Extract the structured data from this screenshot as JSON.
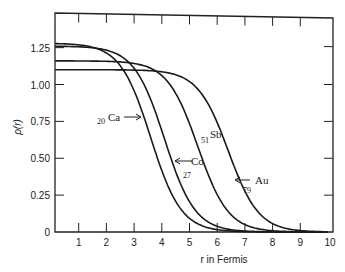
{
  "chart_data": {
    "type": "line",
    "title": "",
    "xlabel": "r  in  Fermis",
    "ylabel": "ρ(r)",
    "xlim": [
      0,
      10
    ],
    "ylim": [
      0,
      1.4
    ],
    "x_ticks": [
      "1",
      "2",
      "3",
      "4",
      "5",
      "6",
      "7",
      "8",
      "9",
      "10"
    ],
    "y_ticks": [
      "0",
      "0.25",
      "0.50",
      "0.75",
      "1.00",
      "1.25"
    ],
    "grid": false,
    "legend": "inline labels with arrows",
    "series": [
      {
        "name": "Ca",
        "mass_sub": "20",
        "label_text": "Ca",
        "rho0": 1.28,
        "c": 3.6,
        "a": 0.55,
        "x": [
          0,
          1,
          2,
          3,
          3.5,
          4,
          4.5,
          5,
          6,
          7
        ],
        "values": [
          1.28,
          1.27,
          1.24,
          1.02,
          0.68,
          0.36,
          0.14,
          0.05,
          0.01,
          0
        ]
      },
      {
        "name": "Co",
        "mass_sub": "27",
        "label_text": "Co",
        "rho0": 1.26,
        "c": 4.1,
        "a": 0.55,
        "x": [
          0,
          1,
          2,
          3,
          4,
          4.5,
          5,
          6,
          7
        ],
        "values": [
          1.26,
          1.26,
          1.24,
          1.14,
          0.68,
          0.4,
          0.17,
          0.03,
          0.005
        ]
      },
      {
        "name": "Sb",
        "mass_sub": "51",
        "label_text": "Sb",
        "rho0": 1.16,
        "c": 5.3,
        "a": 0.55,
        "x": [
          0,
          1,
          2,
          3,
          4,
          5,
          5.5,
          6,
          7,
          8
        ],
        "values": [
          1.16,
          1.16,
          1.16,
          1.15,
          1.1,
          0.75,
          0.5,
          0.26,
          0.05,
          0.005
        ]
      },
      {
        "name": "Au",
        "mass_sub": "79",
        "label_text": "Au",
        "rho0": 1.1,
        "c": 6.4,
        "a": 0.55,
        "x": [
          0,
          2,
          4,
          5,
          6,
          6.5,
          7,
          8,
          9
        ],
        "values": [
          1.1,
          1.1,
          1.09,
          1.03,
          0.74,
          0.5,
          0.27,
          0.05,
          0.005
        ]
      }
    ]
  }
}
